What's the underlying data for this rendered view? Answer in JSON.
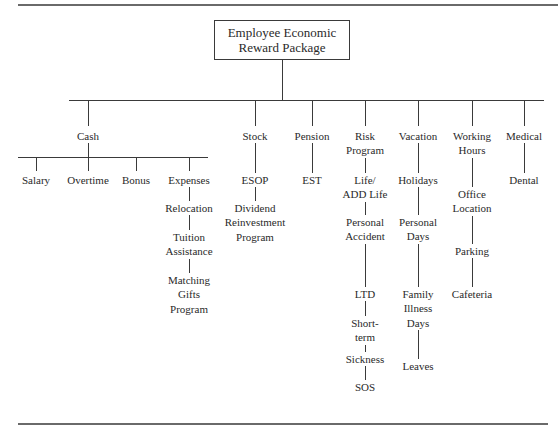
{
  "root": {
    "lines": [
      "Employee Economic",
      "Reward Package"
    ]
  },
  "categories": [
    {
      "id": "cash",
      "label": [
        "Cash"
      ],
      "x": 88,
      "children": [
        {
          "label": [
            "Salary"
          ],
          "x": 36
        },
        {
          "label": [
            "Overtime"
          ],
          "x": 88
        },
        {
          "label": [
            "Bonus"
          ],
          "x": 136
        },
        {
          "label": [
            "Expenses"
          ],
          "x": 189,
          "chain": [
            [
              "Relocation"
            ],
            [
              "Tuition",
              "Assistance"
            ],
            [
              "Matching",
              "Gifts",
              "Program"
            ]
          ]
        }
      ]
    },
    {
      "id": "stock",
      "label": [
        "Stock"
      ],
      "x": 255,
      "chain": [
        [
          "ESOP"
        ],
        [
          "Dividend",
          "Reinvestment",
          "Program"
        ]
      ]
    },
    {
      "id": "pension",
      "label": [
        "Pension"
      ],
      "x": 312,
      "chain": [
        [
          "EST"
        ]
      ]
    },
    {
      "id": "risk-program",
      "label": [
        "Risk",
        "Program"
      ],
      "x": 365,
      "chain": [
        [
          "Life/",
          "ADD Life"
        ],
        [
          "Personal",
          "Accident"
        ],
        [
          "LTD"
        ],
        [
          "Short-",
          "term"
        ],
        [
          "Sickness"
        ],
        [
          "SOS"
        ]
      ]
    },
    {
      "id": "vacation",
      "label": [
        "Vacation"
      ],
      "x": 418,
      "chain": [
        [
          "Holidays"
        ],
        [
          "Personal",
          "Days"
        ],
        [
          "Family",
          "Illness",
          "Days"
        ],
        [
          "Leaves"
        ]
      ]
    },
    {
      "id": "working-hours",
      "label": [
        "Working",
        "Hours"
      ],
      "x": 472,
      "chain": [
        [
          "Office",
          "Location"
        ],
        [
          "Parking"
        ],
        [
          "Cafeteria"
        ]
      ]
    },
    {
      "id": "medical",
      "label": [
        "Medical"
      ],
      "x": 524,
      "chain": [
        [
          "Dental"
        ]
      ]
    }
  ]
}
